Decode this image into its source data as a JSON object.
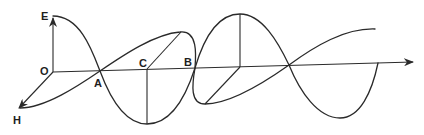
{
  "diagram": {
    "labels": {
      "E": "E",
      "O": "O",
      "H": "H",
      "A": "A",
      "B": "B",
      "C": "C"
    },
    "colors": {
      "stroke": "#2a2a2a",
      "background": "#ffffff"
    },
    "elements": [
      {
        "id": "propagation-axis",
        "from": "O",
        "direction": "right",
        "arrow": true
      },
      {
        "id": "e-vector",
        "from": "O",
        "to": "E",
        "direction": "up",
        "arrow": true
      },
      {
        "id": "h-vector",
        "from": "O",
        "to": "H",
        "direction": "down-left",
        "arrow": true
      },
      {
        "id": "e-wave",
        "description": "vertical-plane sinusoid through nodes A, B and a further node"
      },
      {
        "id": "h-wave",
        "description": "horizontal-plane sinusoid (perspective) through nodes A, B"
      },
      {
        "id": "point-C",
        "description": "midpoint between A and B with vertical and oblique amplitude lines"
      }
    ]
  }
}
